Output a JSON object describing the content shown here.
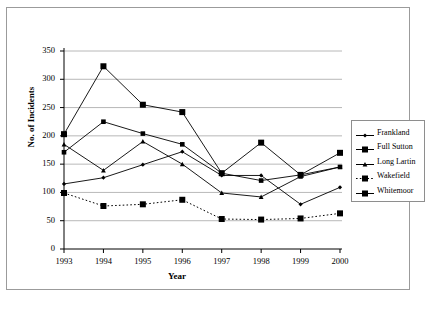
{
  "chart_data": {
    "type": "line",
    "title": "",
    "xlabel": "Year",
    "ylabel": "No. of Incidents",
    "categories": [
      "1993",
      "1994",
      "1995",
      "1996",
      "1997",
      "1998",
      "1999",
      "2000"
    ],
    "ylim": [
      0,
      350
    ],
    "ytick_labels": [
      "0",
      "50",
      "100",
      "150",
      "200",
      "250",
      "300",
      "350"
    ],
    "ytick_values": [
      0,
      50,
      100,
      150,
      200,
      250,
      300,
      350
    ],
    "grid": "horizontal",
    "legend_position": "right",
    "series": [
      {
        "name": "Frankland",
        "marker": "diamond",
        "line": "solid",
        "values": [
          115,
          126,
          149,
          172,
          130,
          130,
          79,
          109
        ]
      },
      {
        "name": "Full Sutton",
        "marker": "square",
        "line": "solid",
        "values": [
          171,
          225,
          204,
          185,
          134,
          121,
          131,
          145
        ]
      },
      {
        "name": "Long Lartin",
        "marker": "triangle",
        "line": "solid",
        "values": [
          185,
          139,
          190,
          150,
          99,
          92,
          128,
          145
        ]
      },
      {
        "name": "Wakefield",
        "marker": "square",
        "line": "dotted",
        "values": [
          99,
          76,
          79,
          87,
          53,
          52,
          54,
          63
        ]
      },
      {
        "name": "Whitemoor",
        "marker": "square",
        "line": "solid",
        "values": [
          203,
          323,
          255,
          242,
          134,
          188,
          131,
          170
        ]
      }
    ]
  },
  "axes": {
    "y_title": "No. of Incidents",
    "x_title": "Year"
  },
  "legend": {
    "items": [
      {
        "label": "Frankland"
      },
      {
        "label": "Full Sutton"
      },
      {
        "label": "Long Lartin"
      },
      {
        "label": "Wakefield"
      },
      {
        "label": "Whitemoor"
      }
    ]
  },
  "caption": {
    "text": ""
  },
  "colors": {
    "line": "#000000",
    "grid": "#a6a6a6",
    "axis": "#000000",
    "frame": "#9b9b9b",
    "background": "#ffffff"
  }
}
